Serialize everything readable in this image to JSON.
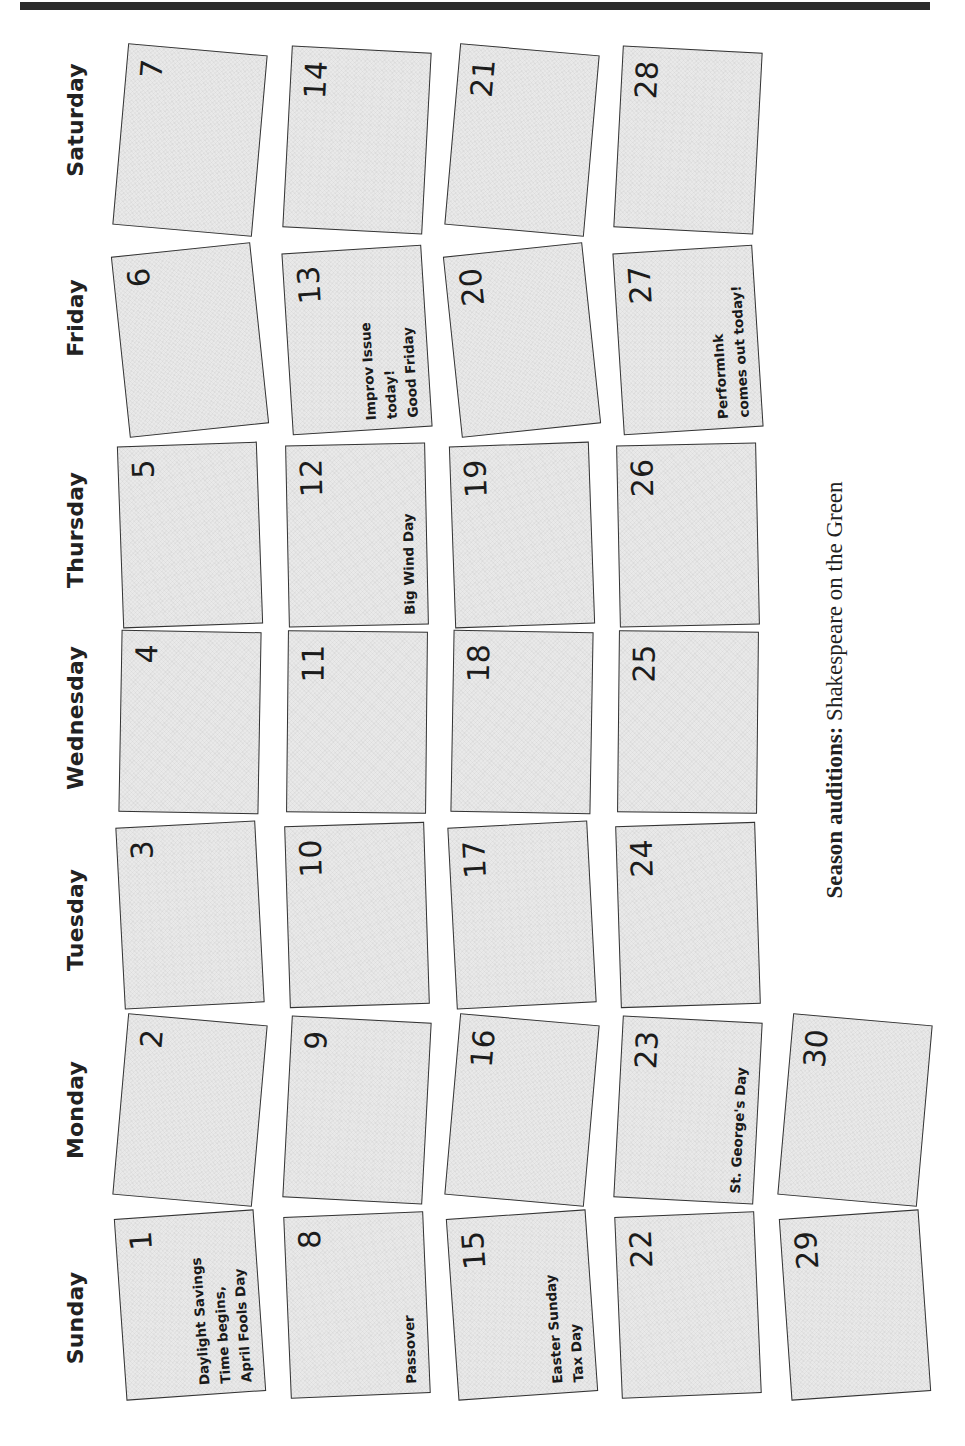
{
  "header_bar_color": "#2b2b2b",
  "days": [
    "Saturday",
    "Friday",
    "Thursday",
    "Wednesday",
    "Tuesday",
    "Monday",
    "Sunday"
  ],
  "tiles": [
    {
      "day": "1",
      "notes": [
        "Daylight Savings",
        "Time begins,",
        "April Fools Day"
      ]
    },
    {
      "day": "2",
      "notes": []
    },
    {
      "day": "3",
      "notes": []
    },
    {
      "day": "4",
      "notes": []
    },
    {
      "day": "5",
      "notes": []
    },
    {
      "day": "6",
      "notes": []
    },
    {
      "day": "7",
      "notes": []
    },
    {
      "day": "8",
      "notes": [
        "Passover"
      ]
    },
    {
      "day": "9",
      "notes": []
    },
    {
      "day": "10",
      "notes": []
    },
    {
      "day": "11",
      "notes": []
    },
    {
      "day": "12",
      "notes": [
        "Big Wind Day"
      ]
    },
    {
      "day": "13",
      "notes": [
        "Improv Issue",
        "today!",
        "Good Friday"
      ]
    },
    {
      "day": "14",
      "notes": []
    },
    {
      "day": "15",
      "notes": [
        "Easter Sunday",
        "Tax Day"
      ]
    },
    {
      "day": "16",
      "notes": []
    },
    {
      "day": "17",
      "notes": []
    },
    {
      "day": "18",
      "notes": []
    },
    {
      "day": "19",
      "notes": []
    },
    {
      "day": "20",
      "notes": []
    },
    {
      "day": "21",
      "notes": []
    },
    {
      "day": "22",
      "notes": []
    },
    {
      "day": "23",
      "notes": [
        "St. George's Day"
      ]
    },
    {
      "day": "24",
      "notes": []
    },
    {
      "day": "25",
      "notes": []
    },
    {
      "day": "26",
      "notes": []
    },
    {
      "day": "27",
      "notes": [
        "PerformInk",
        "comes out today!"
      ]
    },
    {
      "day": "28",
      "notes": []
    },
    {
      "day": "29",
      "notes": []
    },
    {
      "day": "30",
      "notes": []
    }
  ],
  "footer": {
    "label": "Season auditions:",
    "text": "Shakespeare on the Green"
  }
}
